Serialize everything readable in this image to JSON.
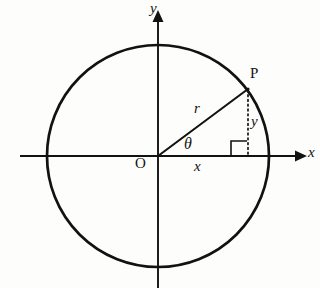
{
  "figure": {
    "kind": "unit-circle-trigonometry-diagram",
    "background_color": "#fdfdfb",
    "ink_color": "#14120f",
    "labels": {
      "y_axis": "y",
      "x_axis": "x",
      "point_p": "P",
      "radius": "r",
      "angle": "θ",
      "origin": "O",
      "x_leg": "x",
      "y_leg": "y"
    },
    "geometry": {
      "center_x": 158,
      "center_y": 156,
      "radius_px": 111,
      "circle_stroke_width": 2.6,
      "axis_stroke_width": 1.8,
      "point_p_x": 248,
      "point_p_y": 89,
      "angle_degrees": 36.6,
      "dotted_drop_from_y": 89,
      "dotted_drop_to_y": 156,
      "right_angle_box_size": 16,
      "angle_arc_radius": 30,
      "x_axis_left": 20,
      "x_axis_right": 300,
      "y_axis_top": 14,
      "y_axis_bottom": 288
    }
  }
}
